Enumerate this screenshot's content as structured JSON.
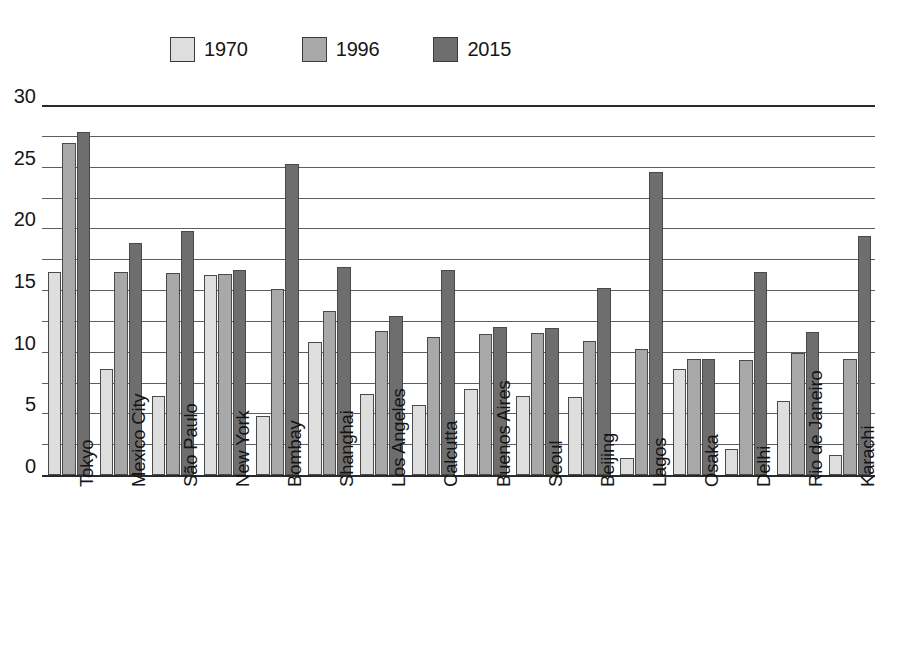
{
  "chart_data": {
    "type": "bar",
    "title": "",
    "subtitle": "",
    "xlabel": "",
    "ylabel": "",
    "ylim": [
      0,
      30
    ],
    "y_ticks": [
      0,
      5,
      10,
      15,
      20,
      25,
      30
    ],
    "y_tick_labels": [
      "0",
      "5",
      "10",
      "15",
      "20",
      "25",
      "30"
    ],
    "gridline_interval": 2.5,
    "grid": true,
    "legend_position": "top",
    "orientation": "vertical",
    "categories": [
      "Tokyo",
      "Mexico City",
      "São Paulo",
      "New York",
      "Bombay",
      "Shanghai",
      "Los Angeles",
      "Calcutta",
      "Buenos Aires",
      "Seoul",
      "Beijing",
      "Lagos",
      "Osaka",
      "Delhi",
      "Rio de Janeiro",
      "Karachi"
    ],
    "series": [
      {
        "name": "1970",
        "color": "#dedede",
        "values": [
          16.5,
          8.6,
          6.4,
          16.2,
          4.8,
          10.8,
          6.6,
          5.7,
          7.0,
          6.4,
          6.3,
          1.4,
          8.6,
          2.1,
          6.0,
          1.6
        ]
      },
      {
        "name": "1996",
        "color": "#a8a8a8",
        "values": [
          26.9,
          16.5,
          16.4,
          16.3,
          15.1,
          13.3,
          11.7,
          11.2,
          11.4,
          11.5,
          10.9,
          10.2,
          9.4,
          9.3,
          9.9,
          9.4
        ]
      },
      {
        "name": "2015",
        "color": "#6e6e6e",
        "values": [
          27.8,
          18.8,
          19.8,
          16.6,
          25.2,
          16.9,
          12.9,
          16.6,
          12.0,
          11.9,
          15.2,
          24.6,
          9.4,
          16.5,
          11.6,
          19.4
        ]
      }
    ]
  },
  "legend": {
    "entries": [
      {
        "label": "1970",
        "color": "#dedede"
      },
      {
        "label": "1996",
        "color": "#a8a8a8"
      },
      {
        "label": "2015",
        "color": "#6e6e6e"
      }
    ]
  },
  "axes": {
    "y_tick_labels": [
      "0",
      "5",
      "10",
      "15",
      "20",
      "25",
      "30"
    ]
  }
}
